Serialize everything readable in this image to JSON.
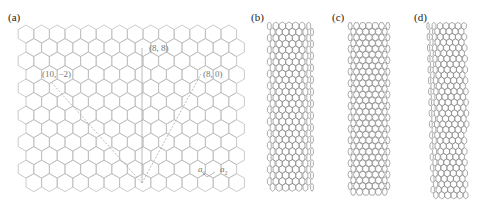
{
  "panels": {
    "a": {
      "label": "(a)",
      "title": "graphene-sheet-with-chiral-vectors"
    },
    "b": {
      "label": "(b)",
      "title": "armchair-nanotube"
    },
    "c": {
      "label": "(c)",
      "title": "zigzag-nanotube"
    },
    "d": {
      "label": "(d)",
      "title": "chiral-nanotube"
    }
  },
  "vectors": {
    "armchair": "(8, 8)",
    "zigzag": "(8, 0)",
    "chiral": "(10, −2)"
  },
  "basis": {
    "a1": "a",
    "a1_sub": "1",
    "a2": "a",
    "a2_sub": "2"
  },
  "colors": {
    "lattice": "#bdbdbd",
    "vector": "#aaaaaa",
    "tube": "#8a8a8a"
  }
}
